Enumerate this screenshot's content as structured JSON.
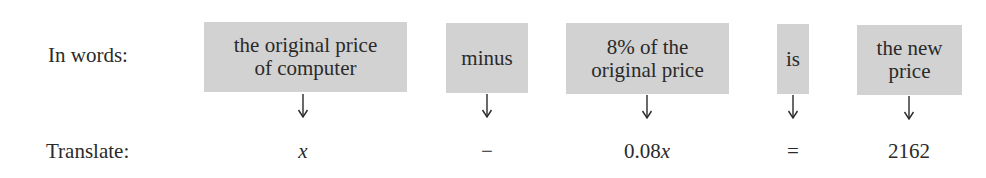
{
  "rows": {
    "words_label": "In words:",
    "translate_label": "Translate:"
  },
  "boxes": [
    {
      "line1": "the original price",
      "line2": "of computer"
    },
    {
      "line1": "minus",
      "line2": ""
    },
    {
      "line1": "8% of the",
      "line2": "original price"
    },
    {
      "line1": "is",
      "line2": ""
    },
    {
      "line1": "the new",
      "line2": "price"
    }
  ],
  "translations": [
    {
      "prefix": "",
      "var": "x"
    },
    {
      "prefix": "−",
      "var": ""
    },
    {
      "prefix": "0.08",
      "var": "x"
    },
    {
      "prefix": "=",
      "var": ""
    },
    {
      "prefix": "2162",
      "var": ""
    }
  ],
  "colors": {
    "box_fill": "#d2d2d2",
    "text": "#2a2a2a"
  }
}
